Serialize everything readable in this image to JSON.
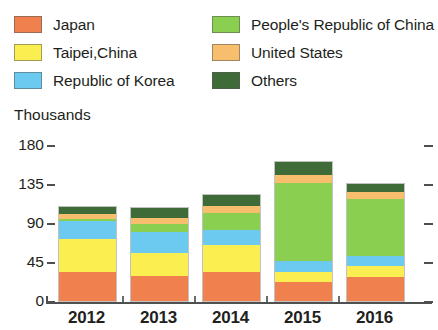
{
  "legend": {
    "columns": [
      {
        "items": [
          {
            "label": "Japan",
            "color": "#F0814E",
            "key": "japan"
          },
          {
            "label": "Taipei,China",
            "color": "#FAEE51",
            "key": "taipei-china"
          },
          {
            "label": "Republic of Korea",
            "color": "#6CC9F0",
            "key": "republic-of-korea"
          }
        ]
      },
      {
        "items": [
          {
            "label": "People's Republic of China",
            "color": "#8ACF4F",
            "key": "peoples-republic-of-china"
          },
          {
            "label": "United States",
            "color": "#F6BE6D",
            "key": "united-states"
          },
          {
            "label": "Others",
            "color": "#3E6B38",
            "key": "others"
          }
        ]
      }
    ]
  },
  "axis": {
    "unit_title": "Thousands",
    "y_ticks": [
      "180",
      "135",
      "90",
      "45",
      "0"
    ],
    "x_labels": [
      "2012",
      "2013",
      "2014",
      "2015",
      "2016"
    ]
  },
  "chart_data": {
    "type": "bar",
    "stacked": true,
    "title": "",
    "subtitle": "",
    "xlabel": "",
    "ylabel": "Thousands",
    "ylim": [
      0,
      180
    ],
    "yticks": [
      0,
      45,
      90,
      135,
      180
    ],
    "grid": false,
    "legend_position": "top",
    "categories": [
      "2012",
      "2013",
      "2014",
      "2015",
      "2016"
    ],
    "series": [
      {
        "name": "Japan",
        "color": "#F0814E",
        "values": [
          34,
          29,
          34,
          22,
          28
        ]
      },
      {
        "name": "Taipei,China",
        "color": "#FAEE51",
        "values": [
          37,
          26,
          31,
          11,
          12
        ]
      },
      {
        "name": "Republic of Korea",
        "color": "#6CC9F0",
        "values": [
          21,
          25,
          17,
          13,
          12
        ]
      },
      {
        "name": "People's Republic of China",
        "color": "#8ACF4F",
        "values": [
          3,
          9,
          20,
          90,
          66
        ]
      },
      {
        "name": "United States",
        "color": "#F6BE6D",
        "values": [
          5,
          7,
          8,
          9,
          8
        ]
      },
      {
        "name": "Others",
        "color": "#3E6B38",
        "values": [
          8,
          11,
          12,
          15,
          9
        ]
      }
    ],
    "totals": [
      108,
      107,
      122,
      160,
      135
    ]
  }
}
